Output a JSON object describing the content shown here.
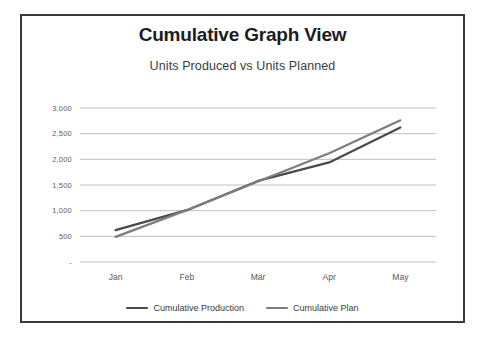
{
  "card": {
    "border_color": "#3a3a3a",
    "background": "#ffffff"
  },
  "chart_data": {
    "type": "line",
    "title": "Cumulative Graph View",
    "subtitle": "Units Produced vs Units Planned",
    "xlabel": "",
    "ylabel": "",
    "categories": [
      "Jan",
      "Feb",
      "Mar",
      "Apr",
      "May"
    ],
    "ylim": [
      0,
      3000
    ],
    "yticks": [
      0,
      500,
      1000,
      1500,
      2000,
      2500,
      3000
    ],
    "ytick_labels": [
      "-",
      "500",
      "1,000",
      "1,500",
      "2,000",
      "2,500",
      "3,000"
    ],
    "grid": "horizontal",
    "legend_position": "bottom",
    "series": [
      {
        "name": "Cumulative Production",
        "color": "#4a4a4a",
        "values": [
          620,
          1010,
          1580,
          1940,
          2620
        ]
      },
      {
        "name": "Cumulative Plan",
        "color": "#7d7d7d",
        "values": [
          490,
          1010,
          1570,
          2120,
          2760
        ]
      }
    ]
  },
  "legend": {
    "items": [
      {
        "label": "Cumulative Production",
        "color": "#4a4a4a"
      },
      {
        "label": "Cumulative Plan",
        "color": "#7d7d7d"
      }
    ]
  }
}
